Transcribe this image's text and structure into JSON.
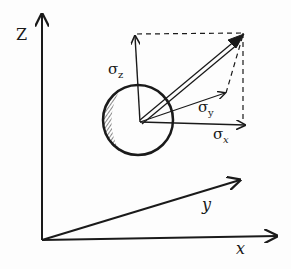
{
  "diagram": {
    "axes": {
      "z_label": "Z",
      "x_label": "x",
      "y_label": "y"
    },
    "components": {
      "sigma_z": "σ",
      "sigma_z_sub": "z",
      "sigma_y": "σ",
      "sigma_y_sub": "y",
      "sigma_x": "σ",
      "sigma_x_sub": "x"
    },
    "colors": {
      "ink": "#1a1a1a",
      "background": "#fdfdfd"
    }
  }
}
